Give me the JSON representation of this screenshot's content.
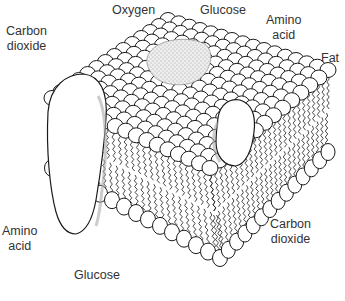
{
  "figure": {
    "labels": {
      "carbon_dioxide_top": [
        "Carbon",
        "dioxide"
      ],
      "oxygen": [
        "Oxygen"
      ],
      "glucose_top": [
        "Glucose"
      ],
      "amino_acid_top": [
        "Amino",
        "acid"
      ],
      "fat": [
        "Fat"
      ],
      "amino_acid_bottom": [
        "Amino",
        "acid"
      ],
      "glucose_bottom": [
        "Glucose"
      ],
      "carbon_dioxide_bottom": [
        "Carbon",
        "dioxide"
      ]
    },
    "colors": {
      "ink": "#1a1a1a",
      "paper": "#ffffff",
      "label": "#333333",
      "stipple": "#9a9a9a"
    }
  }
}
